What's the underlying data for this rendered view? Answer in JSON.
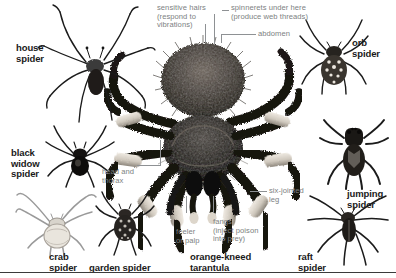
{
  "diagram": {
    "background_color": "#ffffff",
    "species_label_color": "#1a1a1a",
    "anatomy_label_color": "#7d7f82",
    "leader_line_color": "#8e9194",
    "rule_color": "#3b3b3b"
  },
  "species_labels": {
    "house_spider": "house\nspider",
    "black_widow_spider": "black\nwidow\nspider",
    "crab_spider": "crab\nspider",
    "garden_spider": "garden spider",
    "orange_kneed_tarantula": "orange-kneed\ntarantula",
    "raft_spider": "raft\nspider",
    "jumping_spider": "jumping\nspider",
    "orb_spider": "orb\nspider"
  },
  "anatomy_labels": {
    "sensitive_hairs": "sensitive hairs\n(respond to\nvibrations)",
    "spinnerets": "spinnerets under here\n(produce web threads)",
    "abdomen": "abdomen",
    "head_and_thorax": "head and\nthorax",
    "feeler_or_palp": "feeler\nor palp",
    "fangs": "fangs\n(inject poison\ninto prey)",
    "six_jointed_leg": "six-jointed\nleg"
  }
}
